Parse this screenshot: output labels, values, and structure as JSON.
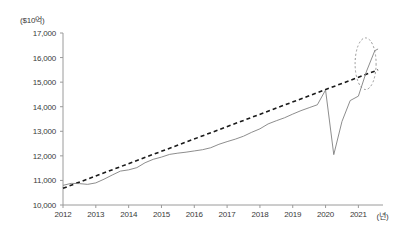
{
  "chart_data": {
    "type": "line",
    "title": "",
    "subtitle": "",
    "unit_label": "($10억)",
    "xlabel": "(년)",
    "ylabel": "",
    "xlim": [
      2012,
      2021.75
    ],
    "ylim": [
      10000,
      17000
    ],
    "grid": false,
    "legend_position": "none",
    "yticks": [
      "10,000",
      "11,000",
      "12,000",
      "13,000",
      "14,000",
      "15,000",
      "16,000",
      "17,000"
    ],
    "ytick_values": [
      10000,
      11000,
      12000,
      13000,
      14000,
      15000,
      16000,
      17000
    ],
    "xticks": [
      "2012",
      "2013",
      "2014",
      "2015",
      "2016",
      "2017",
      "2018",
      "2019",
      "2020",
      "2021"
    ],
    "xtick_values": [
      2012,
      2013,
      2014,
      2015,
      2016,
      2017,
      2018,
      2019,
      2020,
      2021
    ],
    "series": [
      {
        "name": "actual",
        "style": "solid",
        "color": "#808080",
        "x": [
          2012.0,
          2012.25,
          2012.5,
          2012.75,
          2013.0,
          2013.25,
          2013.5,
          2013.75,
          2014.0,
          2014.25,
          2014.5,
          2014.75,
          2015.0,
          2015.25,
          2015.5,
          2015.75,
          2016.0,
          2016.25,
          2016.5,
          2016.75,
          2017.0,
          2017.25,
          2017.5,
          2017.75,
          2018.0,
          2018.25,
          2018.5,
          2018.75,
          2019.0,
          2019.25,
          2019.5,
          2019.75,
          2020.0,
          2020.25,
          2020.5,
          2020.75,
          2021.0,
          2021.25,
          2021.5,
          2021.6
        ],
        "values": [
          10800,
          10880,
          10870,
          10840,
          10900,
          11050,
          11220,
          11380,
          11430,
          11520,
          11720,
          11860,
          11950,
          12060,
          12110,
          12150,
          12200,
          12250,
          12330,
          12470,
          12580,
          12680,
          12800,
          12960,
          13100,
          13300,
          13430,
          13550,
          13700,
          13840,
          13960,
          14080,
          14680,
          12050,
          13400,
          14250,
          14430,
          15450,
          16280,
          16350
        ]
      },
      {
        "name": "trend",
        "style": "dashed",
        "color": "#1a1a1a",
        "x": [
          2012.0,
          2021.6
        ],
        "values": [
          10680,
          15500
        ]
      }
    ],
    "annotations": [
      {
        "type": "ellipse",
        "name": "recovery-highlight-ellipse",
        "style": "dotted",
        "color": "#8a8a8a",
        "center_x": 2021.22,
        "center_y": 15750,
        "radius_x": 0.32,
        "radius_y": 1050
      }
    ]
  },
  "axes": {
    "axis_color": "#9a9a9a",
    "text_color": "#3a3a3a"
  }
}
